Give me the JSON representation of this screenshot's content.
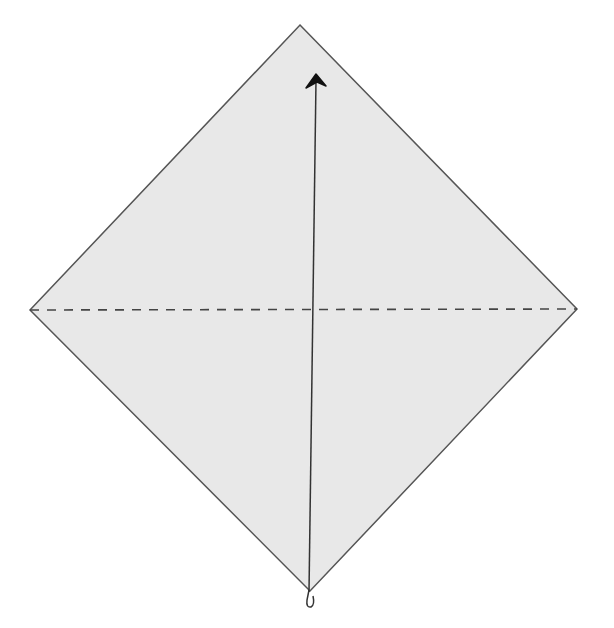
{
  "diagram": {
    "type": "origami-step",
    "paper": {
      "shape": "square-diamond",
      "fill": "#e8e8e8",
      "stroke": "#555555",
      "vertices": {
        "top": [
          300,
          25
        ],
        "right": [
          577,
          309
        ],
        "bottom": [
          310,
          591
        ],
        "left": [
          30,
          310
        ]
      }
    },
    "fold_line": {
      "style": "valley-dashed",
      "from": [
        30,
        310
      ],
      "to": [
        577,
        309
      ],
      "color": "#444444"
    },
    "arrow": {
      "kind": "fold-up-arrow",
      "from": [
        308,
        597
      ],
      "to": [
        316,
        78
      ],
      "color": "#222222"
    }
  }
}
